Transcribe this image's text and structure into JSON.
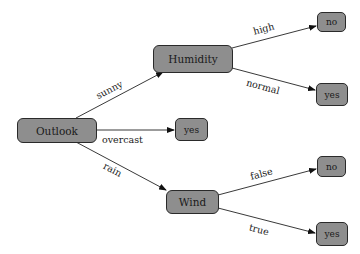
{
  "diagram": {
    "type": "decision-tree",
    "node_fill": "#8e8e8e",
    "node_border": "#2a2a2a",
    "nodes": {
      "outlook": "Outlook",
      "humidity": "Humidity",
      "wind": "Wind",
      "humidity_high_leaf": "no",
      "humidity_normal_leaf": "yes",
      "overcast_leaf": "yes",
      "wind_false_leaf": "no",
      "wind_true_leaf": "yes"
    },
    "edges": {
      "sunny": "sunny",
      "overcast": "overcast",
      "rain": "rain",
      "high": "high",
      "normal": "normal",
      "false": "false",
      "true": "true"
    }
  }
}
